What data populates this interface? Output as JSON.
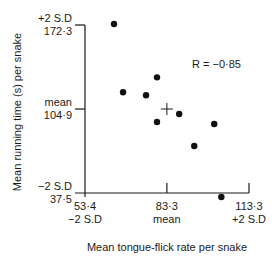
{
  "chart_data": {
    "type": "scatter",
    "title": "",
    "xlabel": "Mean tongue-flick rate per snake",
    "ylabel": "Mean running time (s) per snake",
    "xlim": [
      53.4,
      113.3
    ],
    "ylim": [
      37.5,
      172.3
    ],
    "x_ticks": [
      {
        "value": 53.4,
        "label": "53·4",
        "sublabel": "−2 S.D"
      },
      {
        "value": 83.3,
        "label": "83·3",
        "sublabel": "mean"
      },
      {
        "value": 113.3,
        "label": "113·3",
        "sublabel": "+2 S.D"
      }
    ],
    "y_ticks": [
      {
        "value": 172.3,
        "label": "172·3",
        "sublabel": "+2 S.D"
      },
      {
        "value": 104.9,
        "label": "104·9",
        "sublabel": "mean"
      },
      {
        "value": 37.5,
        "label": "37·5",
        "sublabel": "−2 S.D"
      }
    ],
    "points": [
      {
        "x": 64.0,
        "y": 173.1
      },
      {
        "x": 67.3,
        "y": 118.3
      },
      {
        "x": 79.7,
        "y": 130.3
      },
      {
        "x": 75.7,
        "y": 115.9
      },
      {
        "x": 79.7,
        "y": 94.5
      },
      {
        "x": 87.8,
        "y": 100.9
      },
      {
        "x": 100.6,
        "y": 92.9
      },
      {
        "x": 93.3,
        "y": 75.2
      },
      {
        "x": 103.2,
        "y": 34.3
      }
    ],
    "mean_marker": {
      "x": 83.3,
      "y": 104.9,
      "symbol": "+"
    },
    "annotation": "R = −0·85",
    "annotation_position": "top-right",
    "grid": false,
    "legend": null
  }
}
